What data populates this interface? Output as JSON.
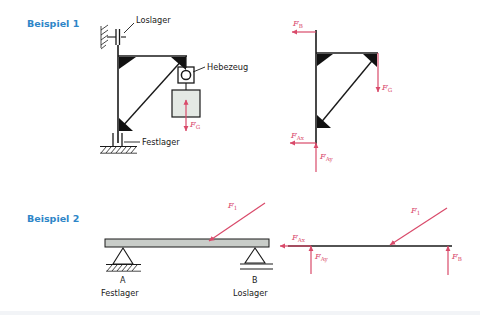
{
  "page": {
    "background": "#ffffff",
    "width": 480,
    "height": 315
  },
  "colors": {
    "example_label": "#2E86C8",
    "force": "#D94A6A",
    "line": "#1a1a1a",
    "beam_fill": "#c9cdc9",
    "load_fill": "#e4e9e4"
  },
  "example1": {
    "title": "Beispiel 1",
    "system_labels": {
      "loslager": "Loslager",
      "hebezeug": "Hebezeug",
      "festlager": "Festlager"
    },
    "forces": {
      "weight": "F",
      "weight_sub": "G"
    },
    "freebody_forces": [
      {
        "name": "F",
        "sub": "B",
        "direction": "left"
      },
      {
        "name": "F",
        "sub": "G",
        "direction": "down"
      },
      {
        "name": "F",
        "sub": "Ax",
        "direction": "left"
      },
      {
        "name": "F",
        "sub": "Ay",
        "direction": "up"
      }
    ]
  },
  "example2": {
    "title": "Beispiel 2",
    "supports": [
      {
        "node": "A",
        "type": "Festlager"
      },
      {
        "node": "B",
        "type": "Loslager"
      }
    ],
    "forces": {
      "load": "F",
      "load_sub": "1"
    },
    "freebody_forces": [
      {
        "name": "F",
        "sub": "Ax",
        "direction": "left"
      },
      {
        "name": "F",
        "sub": "Ay",
        "direction": "up"
      },
      {
        "name": "F",
        "sub": "1",
        "direction": "diagonal-down-left"
      },
      {
        "name": "F",
        "sub": "B",
        "direction": "up"
      }
    ]
  }
}
